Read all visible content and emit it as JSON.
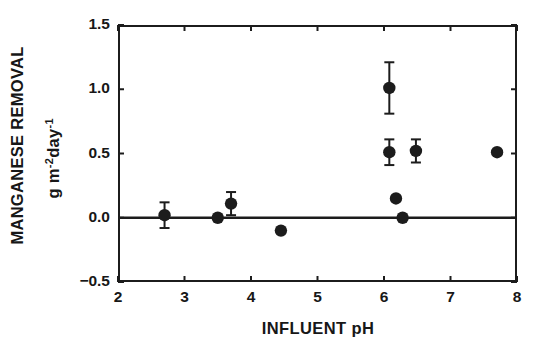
{
  "chart_data": {
    "type": "scatter",
    "title": "",
    "xlabel": "INFLUENT pH",
    "ylabel": "MANGANESE REMOVAL",
    "ylabel_units_plain": "g m-2day-1",
    "ylabel_units": {
      "base1": "g m",
      "exp1": "-2",
      "base2": "day",
      "exp2": "-1"
    },
    "xlim": [
      2,
      8
    ],
    "ylim": [
      -0.5,
      1.5
    ],
    "xticks": [
      2,
      3,
      4,
      5,
      6,
      7,
      8
    ],
    "yticks": [
      -0.5,
      0.0,
      0.5,
      1.0,
      1.5
    ],
    "xtick_labels": [
      "2",
      "3",
      "4",
      "5",
      "6",
      "7",
      "8"
    ],
    "ytick_labels": [
      "-0.5",
      "0.0",
      "0.5",
      "1.0",
      "1.5"
    ],
    "grid": false,
    "legend": "none",
    "zero_reference_line": 0.0,
    "marker": "filled-circle",
    "marker_color": "#1c1c1c",
    "points": [
      {
        "x": 2.7,
        "y": 0.02,
        "yerr": 0.1,
        "has_error_bar": true
      },
      {
        "x": 3.5,
        "y": 0.0,
        "yerr": null,
        "has_error_bar": false
      },
      {
        "x": 3.7,
        "y": 0.11,
        "yerr": 0.09,
        "has_error_bar": true
      },
      {
        "x": 4.45,
        "y": -0.1,
        "yerr": null,
        "has_error_bar": false
      },
      {
        "x": 6.08,
        "y": 1.01,
        "yerr": 0.2,
        "has_error_bar": true
      },
      {
        "x": 6.08,
        "y": 0.51,
        "yerr": 0.1,
        "has_error_bar": true
      },
      {
        "x": 6.18,
        "y": 0.15,
        "yerr": null,
        "has_error_bar": false
      },
      {
        "x": 6.28,
        "y": 0.0,
        "yerr": null,
        "has_error_bar": false
      },
      {
        "x": 6.48,
        "y": 0.52,
        "yerr": 0.09,
        "has_error_bar": true
      },
      {
        "x": 7.7,
        "y": 0.51,
        "yerr": null,
        "has_error_bar": false
      }
    ]
  },
  "colors": {
    "axis": "#1c1c1c",
    "marker": "#1c1c1c",
    "background": "#ffffff"
  }
}
